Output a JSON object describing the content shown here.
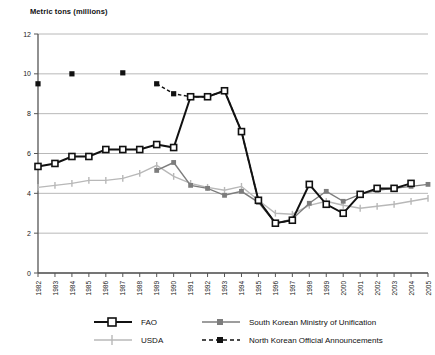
{
  "chart_data": {
    "type": "line",
    "title": "",
    "ylabel": "Metric tons (millions)",
    "xlabel": "",
    "ylim": [
      0,
      12
    ],
    "yticks": [
      0,
      2,
      4,
      6,
      8,
      10,
      12
    ],
    "grid": true,
    "legend_position": "bottom",
    "x": [
      "1982",
      "1983",
      "1984",
      "1985",
      "1986",
      "1987",
      "1988",
      "1989",
      "1990",
      "1991",
      "1992",
      "1993",
      "1994",
      "1995",
      "1996",
      "1997",
      "1998",
      "1999",
      "2000",
      "2001",
      "2002",
      "2003",
      "2004",
      "2005"
    ],
    "series": [
      {
        "name": "FAO",
        "color": "#111111",
        "marker": "open-square",
        "line": "solid",
        "values": [
          5.35,
          5.5,
          5.85,
          5.85,
          6.2,
          6.2,
          6.2,
          6.45,
          6.3,
          8.85,
          8.85,
          9.15,
          7.1,
          3.65,
          2.5,
          2.65,
          4.45,
          3.45,
          3.0,
          3.95,
          4.25,
          4.25,
          4.5,
          null
        ]
      },
      {
        "name": "South Korean Ministry of Unification",
        "color": "#7d7d7d",
        "marker": "filled-square",
        "line": "solid",
        "values": [
          null,
          null,
          null,
          null,
          null,
          null,
          null,
          5.15,
          5.55,
          4.4,
          4.25,
          3.9,
          4.1,
          3.55,
          2.5,
          2.7,
          3.5,
          4.1,
          3.6,
          3.95,
          4.15,
          4.25,
          4.35,
          4.45
        ]
      },
      {
        "name": "USDA",
        "color": "#b8b8b8",
        "marker": "plus",
        "line": "solid",
        "values": [
          4.3,
          4.4,
          4.5,
          4.65,
          4.65,
          4.75,
          5.0,
          5.4,
          4.85,
          4.5,
          4.3,
          4.15,
          4.35,
          3.65,
          3.0,
          2.95,
          3.4,
          3.6,
          3.4,
          3.25,
          3.35,
          3.45,
          3.6,
          3.75
        ]
      },
      {
        "name": "North Korean Official Announcements",
        "color": "#111111",
        "marker": "filled-square",
        "line": "dashed",
        "values": [
          9.5,
          null,
          10.0,
          null,
          null,
          10.05,
          null,
          9.5,
          9.0,
          8.85,
          8.85,
          9.15,
          7.1,
          3.65,
          2.5,
          2.65,
          null,
          null,
          null,
          null,
          null,
          null,
          null,
          null
        ]
      }
    ]
  },
  "legend": {
    "items": [
      {
        "label": "FAO",
        "key": "fao"
      },
      {
        "label": "South Korean Ministry of Unification",
        "key": "mou"
      },
      {
        "label": "USDA",
        "key": "usda"
      },
      {
        "label": "North Korean Official Announcements",
        "key": "nk"
      }
    ]
  },
  "colors": {
    "fao": "#111111",
    "mou": "#7d7d7d",
    "usda": "#b8b8b8",
    "nk": "#111111",
    "grid": "#b0b0b0",
    "axis": "#555555"
  }
}
